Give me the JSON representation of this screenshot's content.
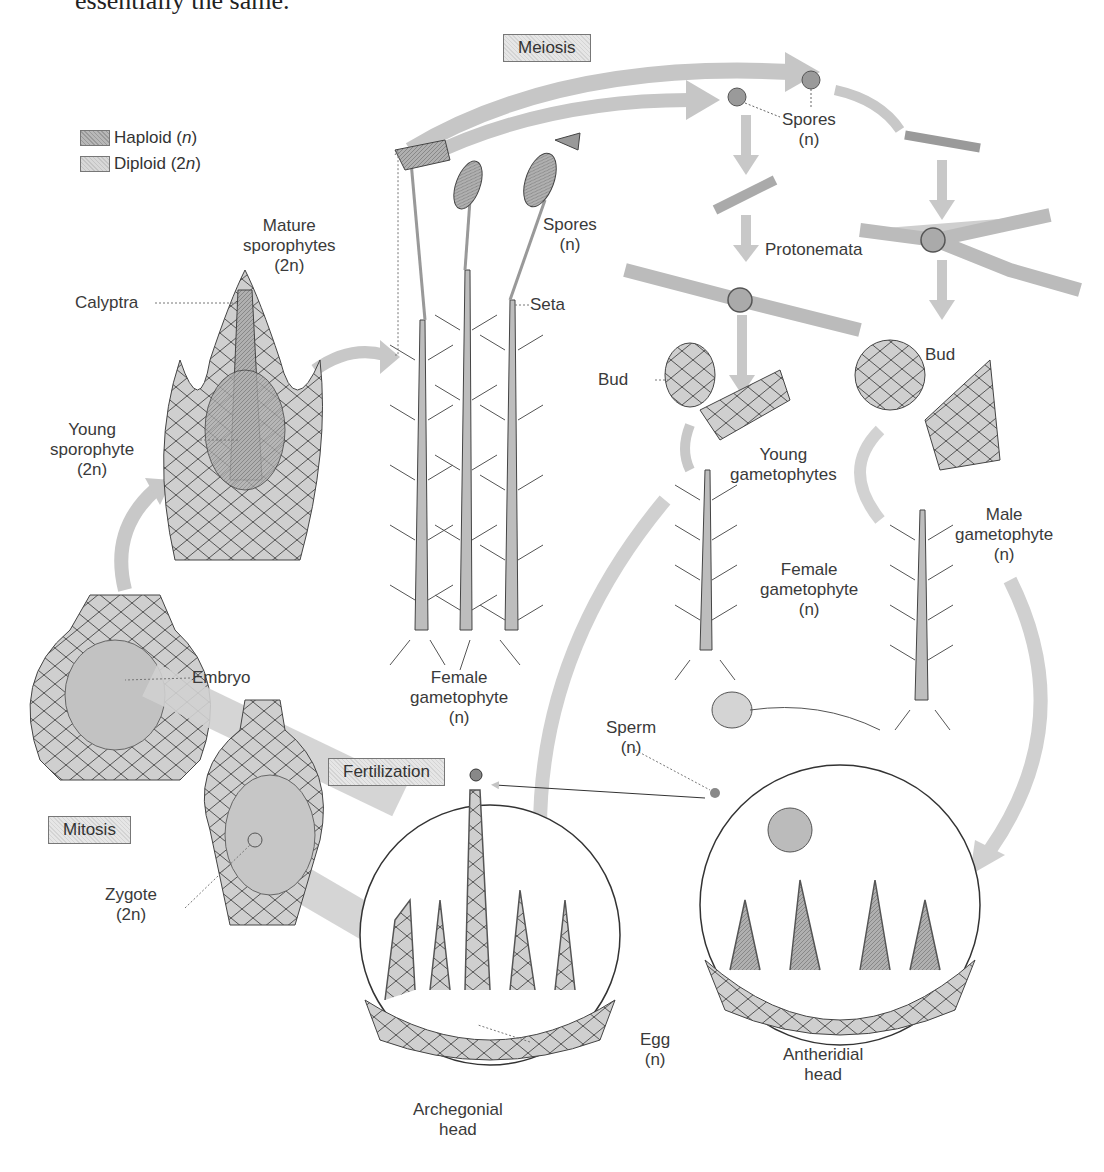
{
  "top_text": "essentially the same.",
  "legend": {
    "items": [
      {
        "label": "Haploid (",
        "var": "n",
        "close": ")",
        "swatch": "haploid"
      },
      {
        "label": "Diploid (2",
        "var": "n",
        "close": ")",
        "swatch": "diploid"
      }
    ]
  },
  "process_boxes": {
    "meiosis": "Meiosis",
    "fertilization": "Fertilization",
    "mitosis": "Mitosis"
  },
  "labels": {
    "spores_top": {
      "line1": "Spores",
      "line2": "(n)"
    },
    "mature_sporophytes": {
      "line1": "Mature",
      "line2": "sporophytes",
      "line3": "(2n)"
    },
    "spores_capsule": {
      "line1": "Spores",
      "line2": "(n)"
    },
    "protonemata": "Protonemata",
    "calyptra": "Calyptra",
    "seta": "Seta",
    "bud_left": "Bud",
    "bud_right": "Bud",
    "young_gametophytes": {
      "line1": "Young",
      "line2": "gametophytes"
    },
    "young_sporophyte": {
      "line1": "Young",
      "line2": "sporophyte",
      "line3": "(2n)"
    },
    "male_gametophyte": {
      "line1": "Male",
      "line2": "gametophyte",
      "line3": "(n)"
    },
    "female_gametophyte_mid": {
      "line1": "Female",
      "line2": "gametophyte",
      "line3": "(n)"
    },
    "embryo": "Embryo",
    "female_gametophyte_left": {
      "line1": "Female",
      "line2": "gametophyte",
      "line3": "(n)"
    },
    "sperm": {
      "line1": "Sperm",
      "line2": "(n)"
    },
    "zygote": {
      "line1": "Zygote",
      "line2": "(2n)"
    },
    "egg": {
      "line1": "Egg",
      "line2": "(n)"
    },
    "antheridial_head": {
      "line1": "Antheridial",
      "line2": "head"
    },
    "archegonial_head": {
      "line1": "Archegonial",
      "line2": "head"
    }
  },
  "colors": {
    "arrow": "#c8c8c8",
    "tissue_light": "#cfcfcf",
    "tissue_dark": "#9e9e9e",
    "outline": "#444444"
  }
}
